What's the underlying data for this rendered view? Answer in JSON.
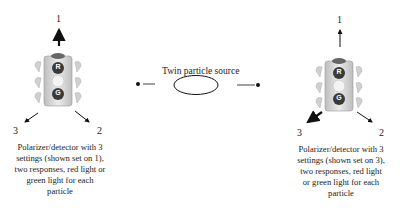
{
  "source": {
    "label": "Twin particle source"
  },
  "detectors": [
    {
      "side": "left",
      "setting_labels": [
        "1",
        "2",
        "3"
      ],
      "active_setting": "1",
      "light_labels": {
        "red": "R",
        "green": "G"
      },
      "caption_lines": [
        "Polarizer/detector with 3",
        "settings (shown set on 1),",
        "two responses, red light or",
        "green light for each",
        "particle"
      ]
    },
    {
      "side": "right",
      "setting_labels": [
        "1",
        "2",
        "3"
      ],
      "active_setting": "3",
      "light_labels": {
        "red": "R",
        "green": "G"
      },
      "caption_lines": [
        "Polarizer/detector with 3",
        "settings (shown set on 3),",
        "two responses, red light",
        "or green light for each",
        "particle"
      ]
    }
  ],
  "colors": {
    "ink": "#111111",
    "light_body": "#d8d8d8",
    "light_dark": "#3a3a3a"
  }
}
